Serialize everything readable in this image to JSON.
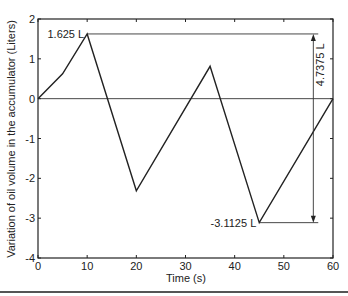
{
  "chart_data": {
    "type": "line",
    "title": "",
    "xlabel": "Time (s)",
    "ylabel": "Variation of oil volume in the accumulator (Liters)",
    "xlim": [
      0,
      60
    ],
    "ylim": [
      -4,
      2
    ],
    "xticks": [
      0,
      10,
      20,
      30,
      40,
      50,
      60
    ],
    "yticks": [
      -4,
      -3,
      -2,
      -1,
      0,
      1,
      2
    ],
    "grid": false,
    "legend": null,
    "series": [
      {
        "name": "Oil volume variation",
        "x": [
          0,
          5,
          10,
          20,
          35,
          45,
          60
        ],
        "y": [
          0,
          0.625,
          1.625,
          -2.3125,
          0.8125,
          -3.1125,
          0
        ]
      }
    ],
    "reference_lines": [
      {
        "type": "hline",
        "y": 0,
        "x_from": 0,
        "x_to": 60
      },
      {
        "type": "hline",
        "y": 1.625,
        "x_from": 10,
        "x_to": 57
      },
      {
        "type": "hline",
        "y": -3.1125,
        "x_from": 45,
        "x_to": 57
      }
    ],
    "annotations": [
      {
        "text": "1.625 L",
        "x": 10,
        "y": 1.625,
        "position": "left"
      },
      {
        "text": "-3.1125 L",
        "x": 45,
        "y": -3.1125,
        "position": "left"
      },
      {
        "text": "4.7375 L",
        "x": 56,
        "y": -0.74375,
        "orientation": "vertical",
        "arrow": "double",
        "from": -3.1125,
        "to": 1.625
      }
    ]
  }
}
